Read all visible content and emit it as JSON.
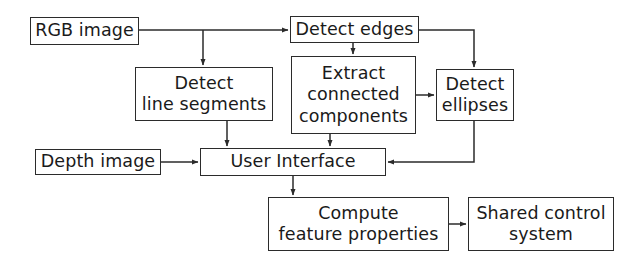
{
  "diagram": {
    "background_color": "#ffffff",
    "stroke_color": "#2b2b2b",
    "text_color": "#1a1a1a",
    "nodes": [
      {
        "id": "rgb_image",
        "label": "RGB image",
        "x": 30,
        "y": 17,
        "w": 109,
        "h": 28
      },
      {
        "id": "detect_edges",
        "label": "Detect edges",
        "x": 290,
        "y": 16,
        "w": 129,
        "h": 27
      },
      {
        "id": "detect_lines",
        "label": "Detect\nline segments",
        "x": 135,
        "y": 67,
        "w": 138,
        "h": 54
      },
      {
        "id": "extract_cc",
        "label": "Extract\nconnected\ncomponents",
        "x": 291,
        "y": 56,
        "w": 125,
        "h": 78
      },
      {
        "id": "detect_ellipses",
        "label": "Detect\nellipses",
        "x": 436,
        "y": 69,
        "w": 78,
        "h": 52
      },
      {
        "id": "depth_image",
        "label": "Depth image",
        "x": 35,
        "y": 149,
        "w": 126,
        "h": 26
      },
      {
        "id": "user_interface",
        "label": "User Interface",
        "x": 200,
        "y": 148,
        "w": 186,
        "h": 28
      },
      {
        "id": "compute_features",
        "label": "Compute\nfeature properties",
        "x": 268,
        "y": 197,
        "w": 181,
        "h": 54
      },
      {
        "id": "shared_control",
        "label": "Shared control\nsystem",
        "x": 468,
        "y": 197,
        "w": 146,
        "h": 54
      }
    ],
    "edges": [
      {
        "id": "rgb-to-detect-edges",
        "from": "rgb_image",
        "to": "detect_edges",
        "points": [
          [
            139,
            30
          ],
          [
            288,
            30
          ]
        ],
        "arrow": true
      },
      {
        "id": "rgb-to-detect-lines",
        "from": "rgb_image",
        "to": "detect_lines",
        "points": [
          [
            203,
            30
          ],
          [
            203,
            65
          ]
        ],
        "arrow": true
      },
      {
        "id": "detect-edges-to-extract",
        "from": "detect_edges",
        "to": "extract_cc",
        "points": [
          [
            353,
            43
          ],
          [
            353,
            54
          ]
        ],
        "arrow": true
      },
      {
        "id": "detect-edges-to-ellipses",
        "from": "detect_edges",
        "to": "detect_ellipses",
        "points": [
          [
            419,
            30
          ],
          [
            474,
            30
          ],
          [
            474,
            67
          ]
        ],
        "arrow": true
      },
      {
        "id": "extract-to-ellipses",
        "from": "extract_cc",
        "to": "detect_ellipses",
        "points": [
          [
            416,
            95
          ],
          [
            434,
            95
          ]
        ],
        "arrow": true
      },
      {
        "id": "detect-lines-to-ui",
        "from": "detect_lines",
        "to": "user_interface",
        "points": [
          [
            227,
            121
          ],
          [
            227,
            146
          ]
        ],
        "arrow": true
      },
      {
        "id": "extract-to-ui",
        "from": "extract_cc",
        "to": "user_interface",
        "points": [
          [
            330,
            134
          ],
          [
            330,
            146
          ]
        ],
        "arrow": true
      },
      {
        "id": "depth-to-ui",
        "from": "depth_image",
        "to": "user_interface",
        "points": [
          [
            161,
            162
          ],
          [
            198,
            162
          ]
        ],
        "arrow": true
      },
      {
        "id": "ellipses-to-ui",
        "from": "detect_ellipses",
        "to": "user_interface",
        "points": [
          [
            474,
            121
          ],
          [
            474,
            162
          ],
          [
            388,
            162
          ]
        ],
        "arrow": true
      },
      {
        "id": "ui-to-compute",
        "from": "user_interface",
        "to": "compute_features",
        "points": [
          [
            293,
            176
          ],
          [
            293,
            195
          ]
        ],
        "arrow": true
      },
      {
        "id": "compute-to-shared",
        "from": "compute_features",
        "to": "shared_control",
        "points": [
          [
            449,
            224
          ],
          [
            466,
            224
          ]
        ],
        "arrow": true
      }
    ]
  }
}
